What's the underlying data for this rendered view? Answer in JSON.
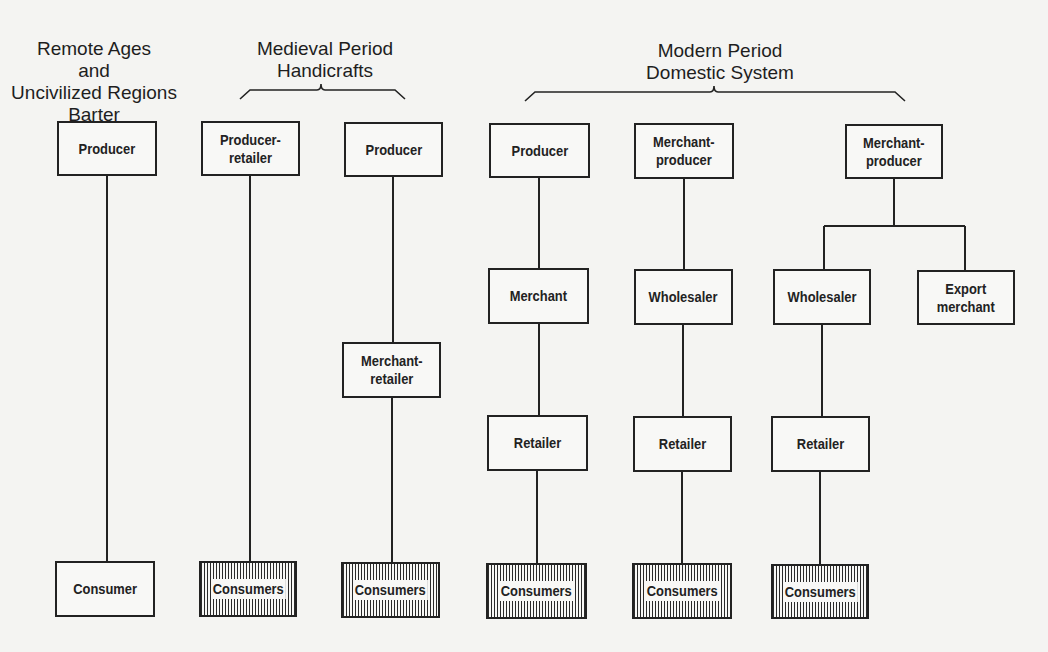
{
  "headings": [
    {
      "id": "barter",
      "text": "Remote Ages\nand\nUncivilized Regions\nBarter",
      "x": 4,
      "y": 38,
      "w": 180
    },
    {
      "id": "medieval",
      "text": "Medieval Period\nHandicrafts",
      "x": 230,
      "y": 38,
      "w": 190
    },
    {
      "id": "modern",
      "text": "Modern Period\nDomestic System",
      "x": 600,
      "y": 40,
      "w": 240
    }
  ],
  "braces": [
    {
      "id": "medieval-brace",
      "x1": 240,
      "x2": 405,
      "y": 90,
      "mid": 321
    },
    {
      "id": "modern-brace",
      "x1": 525,
      "x2": 905,
      "y": 92,
      "mid": 714
    }
  ],
  "boxes": [
    {
      "id": "barter-producer",
      "label": "Producer",
      "x": 57,
      "y": 121,
      "w": 100,
      "h": 55
    },
    {
      "id": "barter-consumer",
      "label": "Consumer",
      "x": 55,
      "y": 561,
      "w": 100,
      "h": 56
    },
    {
      "id": "med1-producer-retailer",
      "label": "Producer-\nretailer",
      "x": 201,
      "y": 121,
      "w": 99,
      "h": 55
    },
    {
      "id": "med1-consumers",
      "label": "Consumers",
      "x": 199,
      "y": 561,
      "w": 98,
      "h": 56,
      "hatched": true
    },
    {
      "id": "med2-producer",
      "label": "Producer",
      "x": 344,
      "y": 122,
      "w": 99,
      "h": 55
    },
    {
      "id": "med2-merchant-retailer",
      "label": "Merchant-\nretailer",
      "x": 342,
      "y": 342,
      "w": 99,
      "h": 56
    },
    {
      "id": "med2-consumers",
      "label": "Consumers",
      "x": 341,
      "y": 562,
      "w": 99,
      "h": 56,
      "hatched": true
    },
    {
      "id": "mod1-producer",
      "label": "Producer",
      "x": 489,
      "y": 123,
      "w": 101,
      "h": 55
    },
    {
      "id": "mod1-merchant",
      "label": "Merchant",
      "x": 488,
      "y": 268,
      "w": 101,
      "h": 56
    },
    {
      "id": "mod1-retailer",
      "label": "Retailer",
      "x": 487,
      "y": 415,
      "w": 101,
      "h": 56
    },
    {
      "id": "mod1-consumers",
      "label": "Consumers",
      "x": 486,
      "y": 563,
      "w": 101,
      "h": 56,
      "hatched": true
    },
    {
      "id": "mod2-merchant-producer",
      "label": "Merchant-\nproducer",
      "x": 634,
      "y": 123,
      "w": 100,
      "h": 56
    },
    {
      "id": "mod2-wholesaler",
      "label": "Wholesaler",
      "x": 634,
      "y": 269,
      "w": 99,
      "h": 56
    },
    {
      "id": "mod2-retailer",
      "label": "Retailer",
      "x": 633,
      "y": 416,
      "w": 99,
      "h": 56
    },
    {
      "id": "mod2-consumers",
      "label": "Consumers",
      "x": 632,
      "y": 563,
      "w": 100,
      "h": 56,
      "hatched": true
    },
    {
      "id": "mod3-merchant-producer",
      "label": "Merchant-\nproducer",
      "x": 845,
      "y": 124,
      "w": 98,
      "h": 55
    },
    {
      "id": "mod3-wholesaler",
      "label": "Wholesaler",
      "x": 773,
      "y": 269,
      "w": 98,
      "h": 56
    },
    {
      "id": "mod3-export-merchant",
      "label": "Export\nmerchant",
      "x": 917,
      "y": 270,
      "w": 98,
      "h": 55
    },
    {
      "id": "mod3-retailer",
      "label": "Retailer",
      "x": 771,
      "y": 416,
      "w": 99,
      "h": 56
    },
    {
      "id": "mod3-consumers",
      "label": "Consumers",
      "x": 771,
      "y": 564,
      "w": 98,
      "h": 55,
      "hatched": true
    }
  ],
  "lines": [
    [
      107,
      176,
      107,
      561
    ],
    [
      250,
      176,
      250,
      561
    ],
    [
      393,
      177,
      393,
      342
    ],
    [
      392,
      398,
      392,
      562
    ],
    [
      539,
      178,
      539,
      268
    ],
    [
      539,
      324,
      539,
      415
    ],
    [
      537,
      471,
      537,
      563
    ],
    [
      684,
      179,
      684,
      269
    ],
    [
      683,
      325,
      683,
      416
    ],
    [
      682,
      472,
      682,
      563
    ],
    [
      894,
      179,
      894,
      226
    ],
    [
      824,
      226,
      965,
      226
    ],
    [
      824,
      226,
      824,
      269
    ],
    [
      965,
      226,
      965,
      270
    ],
    [
      822,
      325,
      822,
      416
    ],
    [
      820,
      472,
      820,
      564
    ]
  ],
  "colors": {
    "ink": "#222222",
    "paper": "#f4f4f2"
  }
}
